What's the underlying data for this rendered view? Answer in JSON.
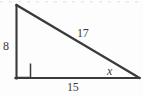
{
  "figure": {
    "kind": "right-triangle-diagram",
    "stroke_color": "#3a3a3c",
    "label_color": "#3c3c3e",
    "background_color": "#fdfdfd",
    "labels": {
      "vertical_leg": "8",
      "hypotenuse": "17",
      "horizontal_leg": "15",
      "unknown_angle": "x"
    },
    "geometry": {
      "apex": [
        16,
        5
      ],
      "right_angle_vertex": [
        16,
        78
      ],
      "right_vertex": [
        139,
        78
      ],
      "right_angle_marker": [
        16,
        63,
        14,
        14
      ]
    }
  }
}
